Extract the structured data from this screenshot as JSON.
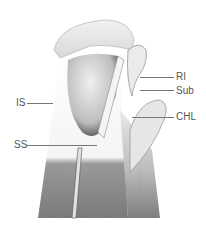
{
  "figure": {
    "labels": [
      {
        "id": "RI",
        "text": "RI"
      },
      {
        "id": "Sub",
        "text": "Sub"
      },
      {
        "id": "CHL",
        "text": "CHL"
      },
      {
        "id": "IS",
        "text": "IS"
      },
      {
        "id": "SS",
        "text": "SS"
      }
    ]
  }
}
